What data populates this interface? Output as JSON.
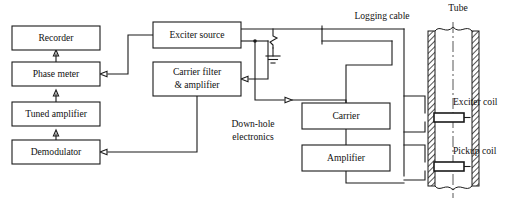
{
  "diagram": {
    "surface_blocks": [
      {
        "id": "recorder",
        "label": "Recorder",
        "x": 12,
        "y": 26,
        "w": 88,
        "h": 24
      },
      {
        "id": "phase-meter",
        "label": "Phase meter",
        "x": 12,
        "y": 62,
        "w": 88,
        "h": 24
      },
      {
        "id": "tuned-amplifier",
        "label": "Tuned amplifier",
        "x": 12,
        "y": 102,
        "w": 88,
        "h": 24
      },
      {
        "id": "demodulator",
        "label": "Demodulator",
        "x": 12,
        "y": 140,
        "w": 88,
        "h": 24
      },
      {
        "id": "exciter-source",
        "label": "Exciter source",
        "x": 153,
        "y": 22,
        "w": 88,
        "h": 26
      }
    ],
    "carrier_filter_block": {
      "id": "carrier-filter-amplifier",
      "line1": "Carrier filter",
      "line2": "& amplifier",
      "x": 153,
      "y": 62,
      "w": 88,
      "h": 34
    },
    "downhole_blocks": [
      {
        "id": "carrier",
        "label": "Carrier",
        "x": 302,
        "y": 103,
        "w": 88,
        "h": 26
      },
      {
        "id": "amplifier",
        "label": "Amplifier",
        "x": 302,
        "y": 145,
        "w": 88,
        "h": 26
      }
    ],
    "free_labels": [
      {
        "id": "logging-cable",
        "text": "Logging cable",
        "x": 382,
        "y": 17,
        "anchor": "middle"
      },
      {
        "id": "tube",
        "text": "Tube",
        "x": 458,
        "y": 9,
        "anchor": "middle"
      },
      {
        "id": "downhole-line1",
        "text": "Down-hole",
        "x": 253,
        "y": 125,
        "anchor": "middle"
      },
      {
        "id": "downhole-line2",
        "text": "electronics",
        "x": 253,
        "y": 138,
        "anchor": "middle"
      },
      {
        "id": "exciter-coil-label",
        "text": "Exciter coil",
        "x": 453,
        "y": 103,
        "anchor": "start"
      },
      {
        "id": "pickup-coil-label",
        "text": "Pickup coil",
        "x": 453,
        "y": 152,
        "anchor": "start"
      }
    ],
    "tube": {
      "left_wall_x": 428,
      "right_wall_x": 472,
      "wall_thickness": 7,
      "top_y": 26,
      "bottom_y": 190,
      "centerline_x": 453
    },
    "coils": [
      {
        "id": "exciter-coil",
        "x": 434,
        "y": 113,
        "w": 30,
        "h": 9
      },
      {
        "id": "pickup-coil",
        "x": 434,
        "y": 162,
        "w": 30,
        "h": 9
      }
    ],
    "ground_symbol": {
      "id": "ground-symbol",
      "x": 273,
      "y": 56
    },
    "colors": {
      "stroke": "#1a1a1a",
      "background": "#ffffff",
      "text": "#111111"
    }
  }
}
